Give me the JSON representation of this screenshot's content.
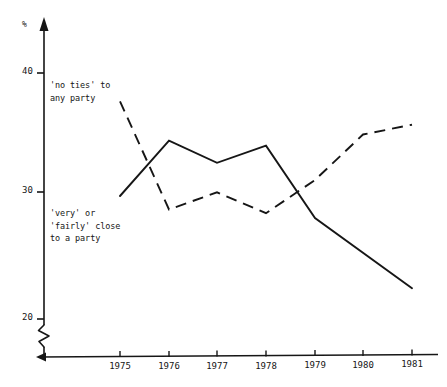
{
  "chart_data": {
    "type": "line",
    "title": "",
    "subtitle": "",
    "xlabel": "",
    "ylabel": "%",
    "x": [
      1975,
      1976,
      1977,
      1978,
      1979,
      1980,
      1981
    ],
    "xtick_labels": [
      "1975",
      "1976",
      "1977",
      "1978",
      "1979",
      "1980",
      "1981"
    ],
    "ytick_labels": [
      "20",
      "30",
      "40"
    ],
    "yticks": [
      20,
      30,
      40
    ],
    "ylim": [
      19,
      42
    ],
    "xlim": [
      1974.6,
      1981.4
    ],
    "grid": false,
    "legend": "inline-annotations",
    "axis_break": true,
    "axis_break_note": "zig-zag break on y-axis below 20",
    "series": [
      {
        "name": "'no ties' to any party",
        "style": "dashed",
        "color": "#161616",
        "x": [
          1975,
          1976,
          1977,
          1978,
          1979,
          1980,
          1981
        ],
        "values": [
          37.7,
          28.9,
          30.3,
          28.6,
          31.3,
          35.0,
          35.8
        ]
      },
      {
        "name": "'very' or 'fairly' close to a party",
        "style": "solid",
        "color": "#161616",
        "x": [
          1975,
          1976,
          1977,
          1978,
          1979,
          1981
        ],
        "values": [
          30.0,
          34.5,
          32.7,
          34.1,
          28.2,
          22.5
        ]
      }
    ],
    "annotations": [
      {
        "id": "no-ties-label",
        "lines": [
          "'no ties' to",
          "any party"
        ],
        "line1": "'no ties' to",
        "line2": "any party"
      },
      {
        "id": "close-to-party-label",
        "lines": [
          "'very' or",
          "'fairly' close",
          "to a party"
        ],
        "line1": "'very' or",
        "line2": "'fairly' close",
        "line3": "to a party"
      }
    ]
  },
  "axis": {
    "y_unit_symbol": "%",
    "y_tick_40": "40",
    "y_tick_30": "30",
    "y_tick_20": "20"
  },
  "xticks": {
    "t1975": "1975",
    "t1976": "1976",
    "t1977": "1977",
    "t1978": "1978",
    "t1979": "1979",
    "t1980": "1980",
    "t1981": "1981"
  },
  "annotations": {
    "no_ties_line1": "'no ties' to",
    "no_ties_line2": "any party",
    "close_line1": "'very' or",
    "close_line2": "'fairly' close",
    "close_line3": "to a party"
  },
  "colors": {
    "ink": "#161616",
    "background": "#ffffff"
  }
}
